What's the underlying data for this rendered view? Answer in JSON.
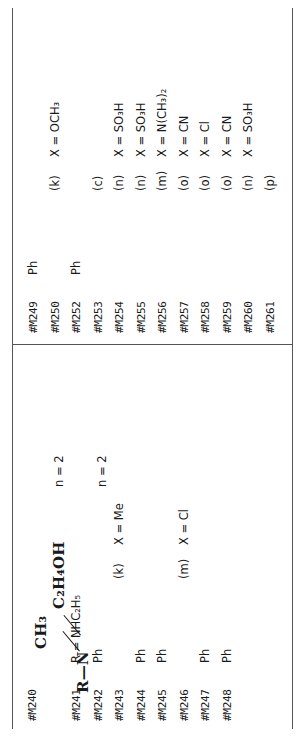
{
  "page": {
    "orientation": "rotated-90-ccw",
    "structure": {
      "core_label": "R=N",
      "branch_top": "CH3",
      "branch_bottom": "C2H4OH",
      "core_display": "R—N",
      "branch_top_display": "CH₃",
      "branch_bottom_display": "C₂H₄OH"
    },
    "notes": {
      "n_note_1": "n = 2",
      "n_note_2": "n = 2"
    },
    "columns": [
      {
        "name": "left-column",
        "rows": [
          {
            "id": "#M240",
            "r": "",
            "iso": "",
            "x": ""
          },
          {
            "id": "",
            "r": "",
            "iso": "",
            "x": ""
          },
          {
            "id": "#M241",
            "r": "R = NHC₂H₅",
            "iso": "",
            "x": ""
          },
          {
            "id": "#M242",
            "r": "Ph",
            "iso": "",
            "x": ""
          },
          {
            "id": "#M243",
            "r": "",
            "iso": "(k)",
            "x": "X = Me"
          },
          {
            "id": "#M244",
            "r": "Ph",
            "iso": "",
            "x": ""
          },
          {
            "id": "#M245",
            "r": "Ph",
            "iso": "",
            "x": ""
          },
          {
            "id": "#M246",
            "r": "",
            "iso": "(m)",
            "x": "X = Cl"
          },
          {
            "id": "#M247",
            "r": "Ph",
            "iso": "",
            "x": ""
          },
          {
            "id": "#M248",
            "r": "Ph",
            "iso": "",
            "x": ""
          }
        ],
        "secondary": [
          {
            "iso": "(k)",
            "x": "X = Me"
          },
          {
            "iso": "(k)",
            "x": "X = Cl"
          },
          {
            "iso": "(m)",
            "x": "X = Cl"
          },
          {
            "iso": "(m)",
            "x": "X = Cl"
          },
          {
            "iso": "(k)",
            "x": "X = OCH₃"
          },
          {
            "iso": "(l)",
            "x": "X = OCH₃"
          }
        ]
      },
      {
        "name": "right-column",
        "rows": [
          {
            "id": "#M249",
            "r": "Ph",
            "iso": "",
            "x": ""
          },
          {
            "id": "#M250",
            "r": "",
            "iso": "(k)",
            "x": "X = OCH₃"
          },
          {
            "id": "#M252",
            "r": "Ph",
            "iso": "",
            "x": ""
          },
          {
            "id": "#M253",
            "r": "",
            "iso": "(c)",
            "x": ""
          },
          {
            "id": "#M254",
            "r": "",
            "iso": "(n)",
            "x": "X = SO₃H"
          },
          {
            "id": "#M255",
            "r": "",
            "iso": "(n)",
            "x": "X = SO₃H"
          },
          {
            "id": "#M256",
            "r": "",
            "iso": "(m)",
            "x": "X = N(CH₃)₂"
          },
          {
            "id": "#M257",
            "r": "",
            "iso": "(o)",
            "x": "X = CN"
          },
          {
            "id": "#M258",
            "r": "",
            "iso": "(o)",
            "x": "X = Cl"
          },
          {
            "id": "#M259",
            "r": "",
            "iso": "(o)",
            "x": "X = CN"
          },
          {
            "id": "#M260",
            "r": "",
            "iso": "(n)",
            "x": "X = SO₃H"
          },
          {
            "id": "#M261",
            "r": "",
            "iso": "(p)",
            "x": ""
          }
        ],
        "secondary": [
          {
            "iso": "(m)",
            "x": "X = OCH₃"
          },
          {
            "iso": "(k)",
            "x": "X = OCH₃"
          },
          {
            "iso": "(c)",
            "x": ""
          },
          {
            "iso": "(c)",
            "x": ""
          },
          {
            "iso": "(n)",
            "x": "X = SO₃H"
          },
          {
            "iso": "(n)",
            "x": "X = SO₃H"
          },
          {
            "iso": "(m)",
            "x": "X = N(CH₃)₂"
          },
          {
            "iso": "(o)",
            "x": "X = CN"
          },
          {
            "iso": "(o)",
            "x": "X = Cl"
          },
          {
            "iso": "(o)",
            "x": "X = CN"
          },
          {
            "iso": "(n)",
            "x": "X = SO₃H"
          },
          {
            "iso": "(p)",
            "x": ""
          }
        ]
      }
    ]
  }
}
